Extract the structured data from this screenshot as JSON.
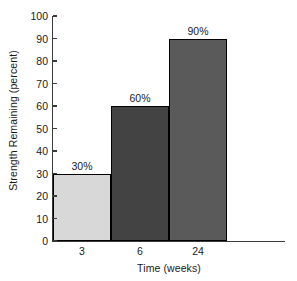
{
  "chart_data": {
    "type": "bar",
    "title": "",
    "xlabel": "Time (weeks)",
    "ylabel": "Strength Remaining (percent)",
    "categories": [
      "3",
      "6",
      "24"
    ],
    "values": [
      30,
      60,
      90
    ],
    "data_labels": [
      "30%",
      "60%",
      "90%"
    ],
    "bar_colors": [
      "#d8d8d8",
      "#434343",
      "#5a5a5a"
    ],
    "bar_edge_color": "#000000",
    "axis_color": "#3a3a3a",
    "ylim": [
      0,
      100
    ],
    "ytick_values": [
      0,
      10,
      20,
      30,
      40,
      50,
      60,
      70,
      80,
      90,
      100
    ],
    "ytick_labels": [
      "0",
      "10",
      "20",
      "30",
      "40",
      "50",
      "60",
      "70",
      "80",
      "90",
      "100"
    ],
    "grid": false,
    "legend": null,
    "legend_position": "none",
    "bar_gap": 0
  }
}
